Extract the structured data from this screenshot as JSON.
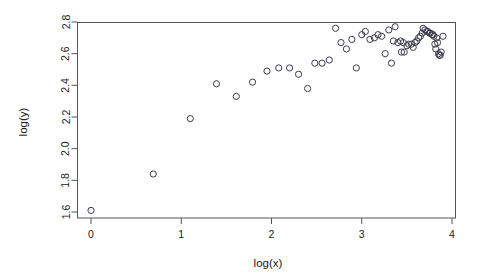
{
  "chart_data": {
    "type": "scatter",
    "title": "",
    "xlabel": "log(x)",
    "ylabel": "log(y)",
    "xlim": [
      -0.15,
      4.05
    ],
    "ylim": [
      1.56,
      2.82
    ],
    "xticks": [
      0,
      1,
      2,
      3,
      4
    ],
    "xticklabels": [
      "0",
      "1",
      "2",
      "3",
      "4"
    ],
    "yticks": [
      1.6,
      1.8,
      2.0,
      2.2,
      2.4,
      2.6,
      2.8
    ],
    "yticklabels": [
      "1.6",
      "1.8",
      "2.0",
      "2.2",
      "2.4",
      "2.6",
      "2.8"
    ],
    "grid": false,
    "legend": false,
    "marker": "open-circle",
    "marker_color": "#3b3b4d",
    "frame_color": "#555555",
    "background": "#ffffff",
    "n_points": 62,
    "series": [
      {
        "name": "observations",
        "points": [
          [
            0.0,
            1.61
          ],
          [
            0.69,
            1.84
          ],
          [
            1.1,
            2.19
          ],
          [
            1.39,
            2.41
          ],
          [
            1.61,
            2.33
          ],
          [
            1.79,
            2.42
          ],
          [
            1.95,
            2.49
          ],
          [
            2.08,
            2.51
          ],
          [
            2.2,
            2.51
          ],
          [
            2.3,
            2.47
          ],
          [
            2.4,
            2.38
          ],
          [
            2.48,
            2.54
          ],
          [
            2.56,
            2.54
          ],
          [
            2.64,
            2.56
          ],
          [
            2.71,
            2.76
          ],
          [
            2.77,
            2.67
          ],
          [
            2.83,
            2.63
          ],
          [
            2.89,
            2.69
          ],
          [
            2.94,
            2.51
          ],
          [
            3.0,
            2.72
          ],
          [
            3.04,
            2.74
          ],
          [
            3.09,
            2.69
          ],
          [
            3.14,
            2.7
          ],
          [
            3.18,
            2.72
          ],
          [
            3.22,
            2.71
          ],
          [
            3.26,
            2.6
          ],
          [
            3.3,
            2.75
          ],
          [
            3.33,
            2.54
          ],
          [
            3.37,
            2.77
          ],
          [
            3.4,
            2.67
          ],
          [
            3.43,
            2.68
          ],
          [
            3.47,
            2.61
          ],
          [
            3.5,
            2.65
          ],
          [
            3.52,
            2.66
          ],
          [
            3.55,
            2.66
          ],
          [
            3.57,
            2.64
          ],
          [
            3.59,
            2.67
          ],
          [
            3.61,
            2.68
          ],
          [
            3.63,
            2.7
          ],
          [
            3.65,
            2.71
          ],
          [
            3.67,
            2.73
          ],
          [
            3.68,
            2.76
          ],
          [
            3.7,
            2.75
          ],
          [
            3.72,
            2.74
          ],
          [
            3.73,
            2.74
          ],
          [
            3.75,
            2.73
          ],
          [
            3.76,
            2.73
          ],
          [
            3.78,
            2.72
          ],
          [
            3.79,
            2.72
          ],
          [
            3.8,
            2.71
          ],
          [
            3.81,
            2.66
          ],
          [
            3.82,
            2.63
          ],
          [
            3.83,
            2.7
          ],
          [
            3.84,
            2.67
          ],
          [
            3.85,
            2.6
          ],
          [
            3.86,
            2.59
          ],
          [
            3.87,
            2.59
          ],
          [
            3.88,
            2.61
          ],
          [
            3.9,
            2.71
          ],
          [
            3.44,
            2.61
          ],
          [
            3.46,
            2.67
          ],
          [
            3.35,
            2.68
          ]
        ]
      }
    ]
  }
}
